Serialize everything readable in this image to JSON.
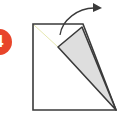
{
  "step": {
    "number": "4",
    "badge_color": "#e8452a"
  },
  "diagram": {
    "paper_fill": "#ffffff",
    "flap_fill": "#dedede",
    "stroke_color": "#3a3a3a",
    "crease_color": "#e6e8b0",
    "arrow_color": "#3a3a3a"
  }
}
